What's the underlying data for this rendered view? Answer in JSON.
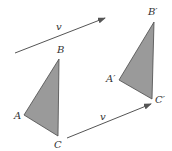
{
  "diagram": {
    "colors": {
      "background": "#ffffff",
      "triangle_fill": "#9a9a9a",
      "triangle_stroke": "#4a4a4a",
      "arrow": "#555555",
      "label": "#333333"
    },
    "vectors": [
      {
        "label": "v",
        "from": [
          15,
          53
        ],
        "to": [
          105,
          18
        ],
        "label_pos": [
          56,
          30
        ]
      },
      {
        "label": "v",
        "from": [
          67,
          138
        ],
        "to": [
          151,
          104
        ],
        "label_pos": [
          100,
          120
        ]
      }
    ],
    "triangles": [
      {
        "name": "original",
        "vertices": [
          {
            "label": "A",
            "pt": [
              24,
              115
            ],
            "label_pos": [
              14,
              119
            ]
          },
          {
            "label": "B",
            "pt": [
              59,
              59
            ],
            "label_pos": [
              57,
              53
            ]
          },
          {
            "label": "C",
            "pt": [
              58,
              136
            ],
            "label_pos": [
              54,
              148
            ]
          }
        ]
      },
      {
        "name": "image",
        "vertices": [
          {
            "label": "A′",
            "pt": [
              119,
              80
            ],
            "label_pos": [
              106,
              82
            ]
          },
          {
            "label": "B′",
            "pt": [
              154,
              22
            ],
            "label_pos": [
              148,
              15
            ]
          },
          {
            "label": "C′",
            "pt": [
              152,
              99
            ],
            "label_pos": [
              155,
              103
            ]
          }
        ]
      }
    ]
  }
}
